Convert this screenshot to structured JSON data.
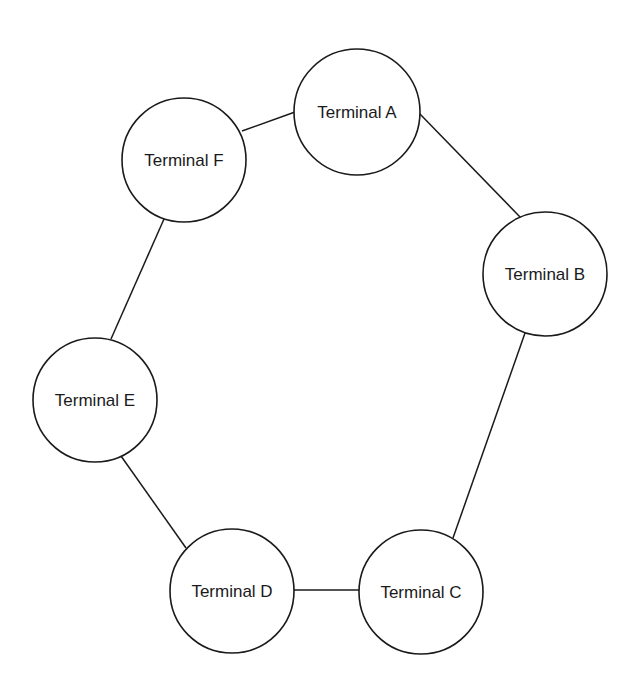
{
  "diagram": {
    "type": "ring-network",
    "nodes": [
      {
        "id": "A",
        "label": "Terminal A",
        "cx": 357,
        "cy": 112,
        "r": 63
      },
      {
        "id": "B",
        "label": "Terminal B",
        "cx": 545,
        "cy": 274,
        "r": 62
      },
      {
        "id": "C",
        "label": "Terminal C",
        "cx": 421,
        "cy": 592,
        "r": 62
      },
      {
        "id": "D",
        "label": "Terminal D",
        "cx": 232,
        "cy": 591,
        "r": 62
      },
      {
        "id": "E",
        "label": "Terminal E",
        "cx": 95,
        "cy": 400,
        "r": 62
      },
      {
        "id": "F",
        "label": "Terminal F",
        "cx": 184,
        "cy": 160,
        "r": 62
      }
    ],
    "edges": [
      {
        "from": "F",
        "to": "A",
        "x1": 242,
        "y1": 131,
        "x2": 295,
        "y2": 112
      },
      {
        "from": "A",
        "to": "B",
        "x1": 419,
        "y1": 113,
        "x2": 521,
        "y2": 218
      },
      {
        "from": "B",
        "to": "C",
        "x1": 525,
        "y1": 333,
        "x2": 453,
        "y2": 538
      },
      {
        "from": "C",
        "to": "D",
        "x1": 294,
        "y1": 590,
        "x2": 359,
        "y2": 590
      },
      {
        "from": "D",
        "to": "E",
        "x1": 186,
        "y1": 548,
        "x2": 121,
        "y2": 456
      },
      {
        "from": "E",
        "to": "F",
        "x1": 111,
        "y1": 339,
        "x2": 164,
        "y2": 219
      }
    ],
    "colors": {
      "stroke": "#1a1a1a",
      "fill": "#ffffff",
      "background": "#ffffff"
    }
  }
}
